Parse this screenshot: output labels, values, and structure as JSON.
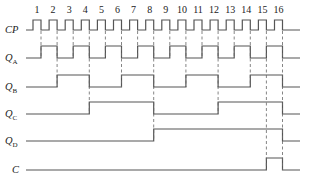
{
  "diagram": {
    "type": "timing-diagram",
    "clock_pulse_labels": [
      "1",
      "2",
      "3",
      "4",
      "5",
      "6",
      "7",
      "8",
      "9",
      "10",
      "11",
      "12",
      "13",
      "14",
      "15",
      "16"
    ],
    "signals": [
      {
        "id": "CP",
        "label": "CP",
        "sub": ""
      },
      {
        "id": "QA",
        "label": "Q",
        "sub": "A"
      },
      {
        "id": "QB",
        "label": "Q",
        "sub": "B"
      },
      {
        "id": "QC",
        "label": "Q",
        "sub": "C"
      },
      {
        "id": "QD",
        "label": "Q",
        "sub": "D"
      },
      {
        "id": "C",
        "label": "C",
        "sub": ""
      }
    ],
    "waveforms": {
      "QA": [
        0,
        1,
        0,
        1,
        0,
        1,
        0,
        1,
        0,
        1,
        0,
        1,
        0,
        1,
        0,
        1,
        0
      ],
      "QB": [
        0,
        0,
        1,
        1,
        0,
        0,
        1,
        1,
        0,
        0,
        1,
        1,
        0,
        0,
        1,
        1,
        0
      ],
      "QC": [
        0,
        0,
        0,
        0,
        1,
        1,
        1,
        1,
        0,
        0,
        0,
        0,
        1,
        1,
        1,
        1,
        0
      ],
      "QD": [
        0,
        0,
        0,
        0,
        0,
        0,
        0,
        0,
        1,
        1,
        1,
        1,
        1,
        1,
        1,
        1,
        0
      ],
      "C": [
        0,
        0,
        0,
        0,
        0,
        0,
        0,
        0,
        0,
        0,
        0,
        0,
        0,
        0,
        0,
        1,
        0
      ]
    },
    "colors": {
      "line": "#555555",
      "dashed": "#666666",
      "text": "#222222"
    }
  }
}
